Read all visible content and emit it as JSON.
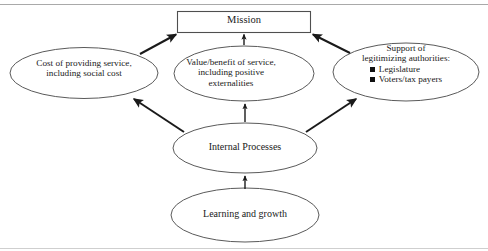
{
  "diagram": {
    "frame": {
      "top_rule": true,
      "bottom_rule": true,
      "rule_color": "#a9a9a9"
    },
    "style": {
      "shape_stroke": "#5a5a5a",
      "arrow_color": "#1a1a1a",
      "text_color": "#1a1a1a",
      "background": "#ffffff"
    },
    "nodes": [
      {
        "id": "mission",
        "shape": "rectangle",
        "label": "Mission",
        "lines": [
          "Mission"
        ]
      },
      {
        "id": "cost",
        "shape": "ellipse",
        "label": "Cost of providing service, including social cost",
        "lines": [
          "Cost of providing service,",
          "including social cost"
        ]
      },
      {
        "id": "value",
        "shape": "ellipse",
        "label": "Value/benefit of service, including positive externalities",
        "lines": [
          "Value/benefit of service,",
          "including positive",
          "externalities"
        ]
      },
      {
        "id": "support",
        "shape": "ellipse",
        "label": "Support of legitimizing authorities",
        "lines": [
          "Support of",
          "legitimizing authorities:"
        ],
        "bullets": [
          "Legislature",
          "Voters/tax payers"
        ],
        "bullet_glyph": "filled-square"
      },
      {
        "id": "internal",
        "shape": "ellipse",
        "label": "Internal Processes",
        "lines": [
          "Internal Processes"
        ]
      },
      {
        "id": "learning",
        "shape": "ellipse",
        "label": "Learning and growth",
        "lines": [
          "Learning and growth"
        ]
      }
    ],
    "edges": [
      {
        "id": "cost-to-mission",
        "from": "cost",
        "to": "mission",
        "style": "thick-diagonal"
      },
      {
        "id": "value-to-mission",
        "from": "value",
        "to": "mission",
        "style": "thin-vertical"
      },
      {
        "id": "support-to-mission",
        "from": "support",
        "to": "mission",
        "style": "thick-diagonal"
      },
      {
        "id": "internal-to-cost",
        "from": "internal",
        "to": "cost",
        "style": "thick-diagonal"
      },
      {
        "id": "internal-to-value",
        "from": "internal",
        "to": "value",
        "style": "thin-vertical"
      },
      {
        "id": "internal-to-support",
        "from": "internal",
        "to": "support",
        "style": "thick-diagonal"
      },
      {
        "id": "learning-to-internal",
        "from": "learning",
        "to": "internal",
        "style": "thin-vertical"
      }
    ]
  }
}
